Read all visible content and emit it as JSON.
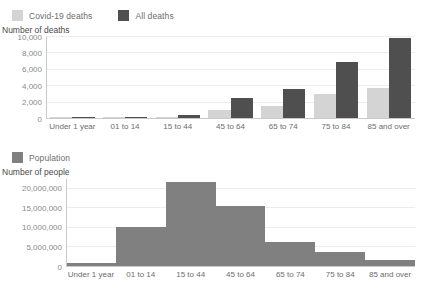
{
  "deaths_panel": {
    "legend": [
      {
        "label": "Covid-19 deaths",
        "color": "#d4d4d4",
        "name": "covid-19-deaths"
      },
      {
        "label": "All deaths",
        "color": "#4f4f4f",
        "name": "all-deaths"
      }
    ],
    "axis_title": "Number of deaths"
  },
  "population_panel": {
    "legend": [
      {
        "label": "Population",
        "color": "#808080",
        "name": "population"
      }
    ],
    "axis_title": "Number of people"
  },
  "chart_data": [
    {
      "type": "bar",
      "title": "Number of deaths",
      "xlabel": "",
      "ylabel": "Number of deaths",
      "ylim": [
        0,
        10000
      ],
      "yticks": [
        0,
        2000,
        4000,
        6000,
        8000,
        10000
      ],
      "ytick_labels": [
        "0",
        "2,000",
        "4,000",
        "6,000",
        "8,000",
        "10,000"
      ],
      "grid": true,
      "legend_position": "top-left",
      "categories": [
        "Under 1 year",
        "01 to 14",
        "15 to 44",
        "45 to 64",
        "65 to 74",
        "75 to 84",
        "85 and over"
      ],
      "series": [
        {
          "name": "Covid-19 deaths",
          "color": "#d4d4d4",
          "values": [
            10,
            10,
            30,
            1000,
            1500,
            2950,
            3600
          ]
        },
        {
          "name": "All deaths",
          "color": "#4f4f4f",
          "values": [
            25,
            30,
            380,
            2400,
            3500,
            6850,
            9800
          ]
        }
      ]
    },
    {
      "type": "bar",
      "title": "Number of people",
      "xlabel": "",
      "ylabel": "Number of people",
      "ylim": [
        0,
        22500000
      ],
      "yticks": [
        0,
        5000000,
        10000000,
        15000000,
        20000000
      ],
      "ytick_labels": [
        "0",
        "5,000,000",
        "10,000,000",
        "15,000,000",
        "20,000,000"
      ],
      "grid": true,
      "legend_position": "top-left",
      "categories": [
        "Under 1 year",
        "01 to 14",
        "15 to 44",
        "45 to 64",
        "65 to 74",
        "75 to 84",
        "85 and over"
      ],
      "series": [
        {
          "name": "Population",
          "color": "#808080",
          "values": [
            700000,
            10000000,
            21500000,
            15300000,
            6200000,
            3700000,
            1500000
          ]
        }
      ]
    }
  ]
}
